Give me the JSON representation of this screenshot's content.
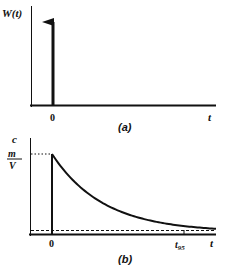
{
  "figure": {
    "panel_a": {
      "caption": "(a)",
      "y_label": "W(t)",
      "x_label": "t",
      "origin_label": "0",
      "description": "Impulse (Dirac delta) input at t = 0"
    },
    "panel_b": {
      "caption": "(b)",
      "y_label": "c",
      "initial_value_numerator": "m",
      "initial_value_denominator": "V",
      "x_label": "t",
      "origin_label": "0",
      "t95_label": "t",
      "t95_subscript": "95",
      "description": "Exponential decay of concentration from m/V starting at t = 0"
    }
  },
  "colors": {
    "ink": "#111111",
    "background": "#ffffff"
  }
}
